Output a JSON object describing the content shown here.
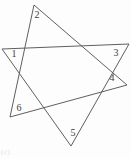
{
  "figure": {
    "width": 131,
    "height": 159,
    "background": "#fdfdfd",
    "stroke_color": "#5f5f5f",
    "stroke_width": 1,
    "label_color": "#3d3d3d",
    "label_font_size": 10,
    "type": "star-polygon-of-two-overlapping-triangles",
    "triangles": [
      {
        "name": "triangle-1-3-5",
        "vertex_labels": [
          "1",
          "3",
          "5"
        ],
        "points": [
          [
            2,
            49
          ],
          [
            129,
            44
          ],
          [
            71,
            146
          ]
        ]
      },
      {
        "name": "triangle-2-4-6",
        "vertex_labels": [
          "2",
          "4",
          "6"
        ],
        "points": [
          [
            34,
            5
          ],
          [
            127,
            85
          ],
          [
            10,
            117
          ]
        ]
      }
    ],
    "vertex_labels": [
      {
        "text": "1",
        "x": 14,
        "y": 56.5
      },
      {
        "text": "2",
        "x": 37,
        "y": 17.5
      },
      {
        "text": "3",
        "x": 116,
        "y": 56
      },
      {
        "text": "4",
        "x": 112,
        "y": 80.5
      },
      {
        "text": "5",
        "x": 73,
        "y": 135.5
      },
      {
        "text": "6",
        "x": 19,
        "y": 110.5
      }
    ],
    "corner_artifact": "(c)"
  }
}
